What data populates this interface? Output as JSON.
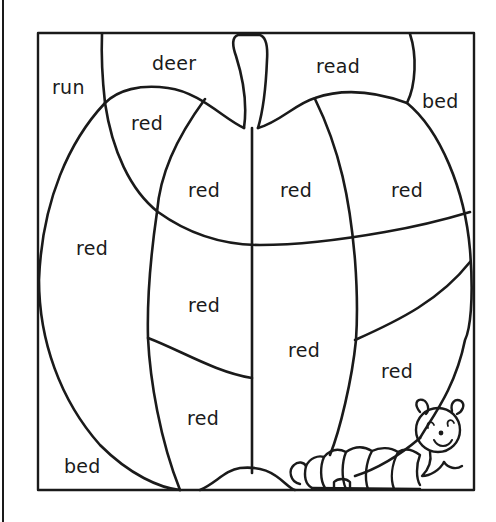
{
  "worksheet": {
    "type": "color-by-word apple",
    "colors": {
      "ink": "#1a1a1a",
      "paper": "#ffffff"
    },
    "regions": [
      {
        "id": "run",
        "label": "run",
        "x": 52,
        "y": 78
      },
      {
        "id": "deer",
        "label": "deer",
        "x": 152,
        "y": 54
      },
      {
        "id": "read",
        "label": "read",
        "x": 316,
        "y": 57
      },
      {
        "id": "bed-top-right",
        "label": "bed",
        "x": 422,
        "y": 92
      },
      {
        "id": "red-top-left",
        "label": "red",
        "x": 131,
        "y": 114
      },
      {
        "id": "red-upper-mid-left",
        "label": "red",
        "x": 188,
        "y": 181
      },
      {
        "id": "red-upper-mid-right",
        "label": "red",
        "x": 280,
        "y": 181
      },
      {
        "id": "red-upper-right",
        "label": "red",
        "x": 391,
        "y": 181
      },
      {
        "id": "red-left",
        "label": "red",
        "x": 76,
        "y": 239
      },
      {
        "id": "red-center-left",
        "label": "red",
        "x": 188,
        "y": 296
      },
      {
        "id": "red-center-right",
        "label": "red",
        "x": 288,
        "y": 341
      },
      {
        "id": "red-lower-right",
        "label": "red",
        "x": 381,
        "y": 362
      },
      {
        "id": "red-bottom-center",
        "label": "red",
        "x": 187,
        "y": 409
      },
      {
        "id": "bed-bottom-left",
        "label": "bed",
        "x": 64,
        "y": 457
      }
    ]
  }
}
